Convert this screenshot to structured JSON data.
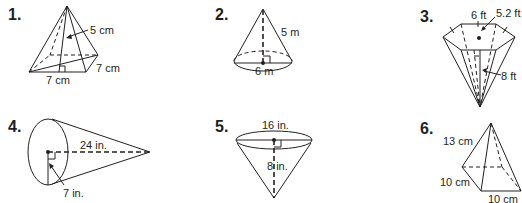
{
  "problems": [
    {
      "number": "1.",
      "shape": "square pyramid",
      "labels": {
        "slant_height": "5 cm",
        "base_front": "7 cm",
        "base_side": "7 cm"
      }
    },
    {
      "number": "2.",
      "shape": "cone",
      "labels": {
        "slant_height": "5 m",
        "diameter": "6 m"
      }
    },
    {
      "number": "3.",
      "shape": "hexagonal pyramid (inverted)",
      "labels": {
        "side": "6 ft",
        "apothem": "5.2 ft",
        "slant_height": "8 ft"
      }
    },
    {
      "number": "4.",
      "shape": "cone (on side)",
      "labels": {
        "height": "24 in.",
        "radius": "7 in."
      }
    },
    {
      "number": "5.",
      "shape": "cone (inverted)",
      "labels": {
        "diameter": "16 in.",
        "height": "8 in."
      }
    },
    {
      "number": "6.",
      "shape": "square pyramid",
      "labels": {
        "lateral_edge": "13 cm",
        "base_left": "10 cm",
        "base_front": "10 cm"
      }
    }
  ]
}
